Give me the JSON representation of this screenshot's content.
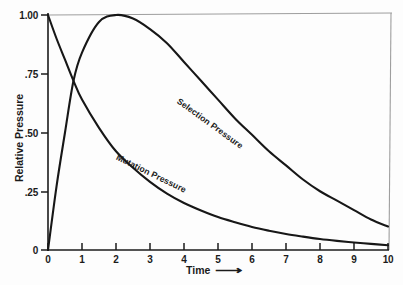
{
  "figure": {
    "background_color": "#fdfdfd",
    "ink_color": "#1b1b1b",
    "frame_color": "#9e9e9e"
  },
  "axes": {
    "y_title": "Relative Pressure",
    "x_title": "Time",
    "x_arrow": "⟶",
    "y_tick_labels": [
      "1.00",
      ".75",
      ".50",
      ".25",
      "0"
    ],
    "x_tick_labels": [
      "0",
      "1",
      "2",
      "3",
      "4",
      "5",
      "6",
      "7",
      "8",
      "9",
      "10"
    ]
  },
  "curve_labels": {
    "selection": "Selection Pressure",
    "mutation": "Mutation Pressure"
  },
  "caption": {
    "fragment": ""
  },
  "chart_data": {
    "type": "line",
    "title": "",
    "subtitle": "",
    "xlabel": "Time",
    "ylabel": "Relative Pressure",
    "xlim": [
      0,
      10
    ],
    "ylim": [
      0,
      1.0
    ],
    "xticks": [
      0,
      1,
      2,
      3,
      4,
      5,
      6,
      7,
      8,
      9,
      10
    ],
    "yticks": [
      0,
      0.25,
      0.5,
      0.75,
      1.0
    ],
    "ytick_labels": [
      "0",
      ".25",
      ".50",
      ".75",
      "1.00"
    ],
    "grid": false,
    "legend": "inline-curve-labels",
    "annotations": [
      "Selection Pressure",
      "Mutation Pressure"
    ],
    "x": [
      0,
      0.25,
      0.5,
      0.75,
      1,
      1.5,
      2,
      2.5,
      3,
      3.5,
      4,
      4.5,
      5,
      5.5,
      6,
      6.5,
      7,
      7.5,
      8,
      8.5,
      9,
      9.5,
      10
    ],
    "series": [
      {
        "name": "Selection Pressure",
        "values": [
          0.0,
          0.27,
          0.5,
          0.72,
          0.84,
          0.97,
          1.0,
          0.985,
          0.94,
          0.88,
          0.8,
          0.72,
          0.64,
          0.56,
          0.49,
          0.42,
          0.36,
          0.3,
          0.25,
          0.21,
          0.17,
          0.13,
          0.1
        ]
      },
      {
        "name": "Mutation Pressure",
        "values": [
          1.0,
          0.9,
          0.81,
          0.72,
          0.64,
          0.52,
          0.42,
          0.35,
          0.29,
          0.24,
          0.2,
          0.168,
          0.14,
          0.118,
          0.098,
          0.082,
          0.068,
          0.057,
          0.047,
          0.039,
          0.032,
          0.026,
          0.02
        ]
      }
    ]
  }
}
